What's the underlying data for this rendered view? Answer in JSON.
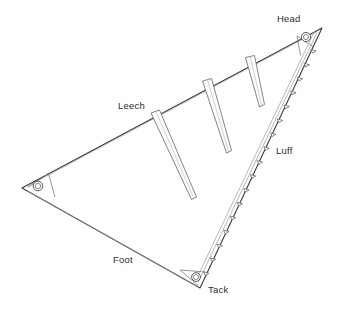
{
  "diagram": {
    "labels": {
      "head": "Head",
      "leech": "Leech",
      "luff": "Luff",
      "foot": "Foot",
      "tack": "Tack"
    },
    "corners": [
      {
        "name": "head",
        "label": "Head",
        "x": 322,
        "y": 28,
        "grommet": {
          "cx": 306,
          "cy": 37,
          "r_outer": 4.6,
          "r_inner": 2.6
        }
      },
      {
        "name": "clew",
        "label": "",
        "x": 22,
        "y": 188,
        "grommet": {
          "cx": 38,
          "cy": 186,
          "r_outer": 4.8,
          "r_inner": 2.7
        }
      },
      {
        "name": "tack",
        "label": "Tack",
        "x": 200,
        "y": 288,
        "grommet": {
          "cx": 196,
          "cy": 277,
          "r_outer": 4.4,
          "r_inner": 2.5
        }
      }
    ],
    "edges": [
      {
        "name": "luff",
        "label": "Luff",
        "from": "tack",
        "to": "head",
        "has_slides": true,
        "slide_count": 18
      },
      {
        "name": "leech",
        "label": "Leech",
        "from": "head",
        "to": "clew",
        "has_slides": false
      },
      {
        "name": "foot",
        "label": "Foot",
        "from": "clew",
        "to": "tack",
        "has_slides": false
      }
    ],
    "battens": [
      {
        "index": 1,
        "name": "batten-pocket-upper"
      },
      {
        "index": 2,
        "name": "batten-pocket-middle"
      },
      {
        "index": 3,
        "name": "batten-pocket-lower"
      }
    ],
    "colors": {
      "outline": "#3a3a3a",
      "hem": "#8a8a8a",
      "sail_fill": "#ffffff",
      "label_text": "#2b2b2b",
      "batten_fill": "#fbfbfb",
      "corner_patch_fill": "#fdfdfd"
    }
  }
}
